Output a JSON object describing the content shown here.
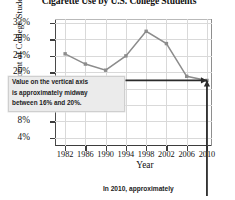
{
  "chart_data": {
    "type": "line",
    "title": "Cigarette Use by U.S. College Students",
    "xlabel": "Year",
    "ylabel": "Percent of College Students",
    "x": [
      1982,
      1986,
      1990,
      1994,
      1998,
      2002,
      2006,
      2010
    ],
    "categories": [
      "1982",
      "1986",
      "1990",
      "1994",
      "1998",
      "2002",
      "2006",
      "2010"
    ],
    "values": [
      24.5,
      22,
      20.5,
      24,
      30,
      27,
      19,
      18
    ],
    "series": [
      {
        "name": "Cigarette use",
        "values": [
          24.5,
          22,
          20.5,
          24,
          30,
          27,
          19,
          18
        ]
      }
    ],
    "ylim": [
      2,
      33
    ],
    "xlim": [
      1980,
      2011
    ],
    "ytick_labels": [
      "32%",
      "28%",
      "24%",
      "20%",
      "16%",
      "12%",
      "8%",
      "4%"
    ],
    "ytick_values": [
      32,
      28,
      24,
      20,
      16,
      12,
      8,
      4
    ],
    "xtick_labels": [
      "1982",
      "1986",
      "1990",
      "1994",
      "1998",
      "2002",
      "2006",
      "2010"
    ],
    "grid": true,
    "legend": "none",
    "line_color": "#8c8c8c",
    "marker_color": "#8c8c8c",
    "annotations": [
      {
        "name": "midway-callout",
        "lines": [
          "Value on the vertical axis",
          "is approximately midway",
          "between 16% and 20%."
        ],
        "arrow": "horizontal-double",
        "arrow_value": 18
      },
      {
        "name": "year-2010-arrow",
        "arrow": "vertical-up",
        "arrow_x": 2010
      }
    ]
  },
  "caption": {
    "bottom": "In 2010, approximately"
  },
  "colors": {
    "series": "#8c8c8c",
    "axis": "#3d3d3d",
    "grid": "#d9d9d9",
    "annotation_bg": "#ebebeb",
    "text": "#1a1a1a"
  }
}
